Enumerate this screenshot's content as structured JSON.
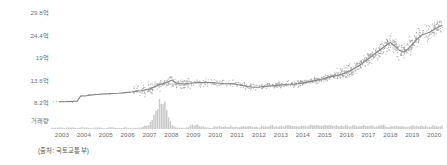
{
  "chart_data": {
    "type": "line",
    "title": "",
    "subtitle": "",
    "xlabel": "",
    "ylabel": "",
    "source_note": "(출처: 국토교통부)",
    "grid": false,
    "legend": "none",
    "price_axis": {
      "tick_labels": [
        "29.8억",
        "24.4억",
        "19억",
        "13.6억",
        "8.2억"
      ],
      "tick_values": [
        29.8,
        24.4,
        19.0,
        13.6,
        8.2
      ],
      "unit": "억",
      "ylim": [
        8.2,
        29.8
      ]
    },
    "volume_axis": {
      "label": "거래량",
      "tick_labels": [
        "거래량"
      ]
    },
    "x": {
      "tick_labels": [
        "2003",
        "2004",
        "2005",
        "2006",
        "2007",
        "2008",
        "2009",
        "2010",
        "2011",
        "2012",
        "2013",
        "2014",
        "2015",
        "2016",
        "2017",
        "2018",
        "2019",
        "2020"
      ],
      "xlim": [
        2003,
        2020.9
      ]
    },
    "series": [
      {
        "name": "평균가격 추세선",
        "type": "line",
        "color": "#8a8a8a",
        "x": [
          2003.4,
          2003.6,
          2003.8,
          2004.0,
          2004.2,
          2004.35,
          2004.45,
          2004.55,
          2004.7,
          2004.9,
          2005.1,
          2005.3,
          2005.5,
          2005.7,
          2005.9,
          2006.1,
          2006.3,
          2006.5,
          2006.7,
          2006.9,
          2007.1,
          2007.3,
          2007.5,
          2007.7,
          2007.9,
          2008.1,
          2008.3,
          2008.5,
          2008.7,
          2008.9,
          2009.1,
          2009.3,
          2009.5,
          2009.7,
          2009.9,
          2010.1,
          2010.3,
          2010.5,
          2010.7,
          2010.9,
          2011.1,
          2011.3,
          2011.5,
          2011.7,
          2011.9,
          2012.1,
          2012.3,
          2012.5,
          2012.7,
          2012.9,
          2013.1,
          2013.3,
          2013.5,
          2013.7,
          2013.9,
          2014.1,
          2014.3,
          2014.5,
          2014.7,
          2014.9,
          2015.1,
          2015.3,
          2015.5,
          2015.7,
          2015.9,
          2016.1,
          2016.3,
          2016.5,
          2016.7,
          2016.9,
          2017.1,
          2017.3,
          2017.5,
          2017.7,
          2017.9,
          2018.1,
          2018.3,
          2018.5,
          2018.7,
          2018.9,
          2019.1,
          2019.3,
          2019.5,
          2019.7,
          2019.9,
          2020.1,
          2020.3,
          2020.5,
          2020.7,
          2020.85
        ],
        "values": [
          8.3,
          8.25,
          8.3,
          8.35,
          8.4,
          9.6,
          9.7,
          9.65,
          9.8,
          9.9,
          10.0,
          10.1,
          10.15,
          10.2,
          10.25,
          10.3,
          10.4,
          10.5,
          10.6,
          10.8,
          10.9,
          11.1,
          11.3,
          11.8,
          12.3,
          12.6,
          12.9,
          13.4,
          12.8,
          12.6,
          12.5,
          12.7,
          12.8,
          12.9,
          12.85,
          12.9,
          12.85,
          12.8,
          12.7,
          12.6,
          12.55,
          12.6,
          12.4,
          12.2,
          12.0,
          11.8,
          11.75,
          11.8,
          11.9,
          12.0,
          12.1,
          12.2,
          12.3,
          12.4,
          12.45,
          12.5,
          12.6,
          12.8,
          13.0,
          13.2,
          13.4,
          13.6,
          13.9,
          14.2,
          14.4,
          14.6,
          14.9,
          15.3,
          15.8,
          16.4,
          17.0,
          17.8,
          18.6,
          19.4,
          20.2,
          21.0,
          21.8,
          22.5,
          21.6,
          20.6,
          20.2,
          20.9,
          22.0,
          23.2,
          24.2,
          24.6,
          25.0,
          25.6,
          26.2,
          26.6
        ]
      },
      {
        "name": "실거래 산점도",
        "type": "scatter",
        "color": "#9a9a9a",
        "note": "개별 실거래 가격 점. 2007-2009 및 2016-2020 구간에 밀집."
      },
      {
        "name": "거래량",
        "type": "bar",
        "color": "#c9c9c9",
        "note": "하단 거래량 막대. 2008년 초 대형 스파이크."
      }
    ]
  }
}
